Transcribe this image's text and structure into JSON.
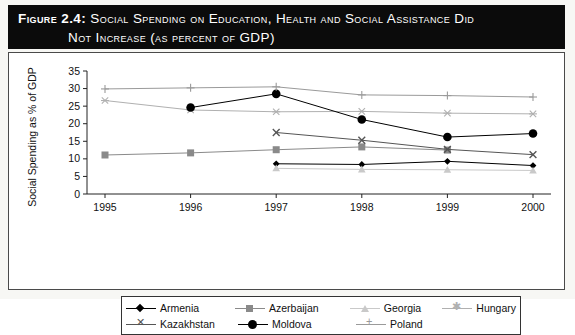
{
  "figure": {
    "label": "Figure 2.4:",
    "title_line1": "Social Spending on Education, Health and Social Assistance Did",
    "title_line2": "Not Increase (as percent of GDP)"
  },
  "chart_data": {
    "type": "line",
    "title": "Social Spending on Education, Health and Social Assistance Did Not Increase (as percent of GDP)",
    "xlabel": "",
    "ylabel": "Social Spending as % of GDP",
    "categories": [
      "1995",
      "1996",
      "1997",
      "1998",
      "1999",
      "2000"
    ],
    "ylim": [
      0,
      35
    ],
    "ytick_step": 5,
    "yticks": [
      "0",
      "5",
      "10",
      "15",
      "20",
      "25",
      "30",
      "35"
    ],
    "grid": false,
    "legend_position": "bottom",
    "series": [
      {
        "name": "Armenia",
        "marker": "diamond",
        "color": "#000000",
        "values": [
          null,
          null,
          8.6,
          8.4,
          9.3,
          8.1
        ]
      },
      {
        "name": "Azerbaijan",
        "marker": "square",
        "color": "#8a8a8a",
        "values": [
          11.1,
          11.7,
          12.6,
          13.4,
          12.5,
          null
        ]
      },
      {
        "name": "Georgia",
        "marker": "triangle",
        "color": "#c9c9c9",
        "values": [
          null,
          null,
          7.3,
          7.0,
          6.9,
          6.7
        ]
      },
      {
        "name": "Hungary",
        "marker": "star",
        "color": "#b0b0b0",
        "values": [
          26.6,
          23.9,
          23.4,
          23.5,
          23.0,
          22.8
        ]
      },
      {
        "name": "Kazakhstan",
        "marker": "x",
        "color": "#555555",
        "values": [
          null,
          null,
          17.5,
          15.3,
          12.7,
          11.2
        ]
      },
      {
        "name": "Moldova",
        "marker": "circle",
        "color": "#000000",
        "values": [
          null,
          24.6,
          28.5,
          21.2,
          16.2,
          17.2
        ]
      },
      {
        "name": "Poland",
        "marker": "plus",
        "color": "#9a9a9a",
        "values": [
          29.9,
          30.2,
          30.5,
          28.2,
          28.0,
          27.6
        ]
      }
    ]
  },
  "legend": {
    "rows": [
      [
        {
          "label": "Armenia",
          "marker": "diamond"
        },
        {
          "label": "Azerbaijan",
          "marker": "square"
        },
        {
          "label": "Georgia",
          "marker": "triangle"
        },
        {
          "label": "Hungary",
          "marker": "star"
        }
      ],
      [
        {
          "label": "Kazakhstan",
          "marker": "x"
        },
        {
          "label": "Moldova",
          "marker": "circle"
        },
        {
          "label": "Poland",
          "marker": "plus"
        }
      ]
    ]
  }
}
